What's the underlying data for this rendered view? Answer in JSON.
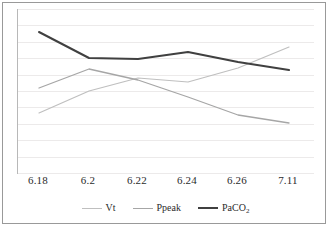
{
  "chart_data": {
    "type": "line",
    "title": "",
    "xlabel": "",
    "ylabel": "",
    "grid": true,
    "legend_position": "bottom",
    "categories": [
      "6.18",
      "6.2",
      "6.22",
      "6.24",
      "6.26",
      "7.11"
    ],
    "y_axis_visible_ticks": false,
    "ylim": [
      0,
      100
    ],
    "gridline_count": 11,
    "series": [
      {
        "name": "Vt",
        "color": "#bfbfbf",
        "line_width": 1.2,
        "values": [
          29,
          42,
          51,
          48,
          58,
          75
        ]
      },
      {
        "name": "Ppeak",
        "color": "#a6a6a6",
        "line_width": 1.3,
        "values": [
          44,
          57,
          50,
          38,
          27,
          23
        ]
      },
      {
        "name": "PaCO2",
        "name_display": "PaCO",
        "name_subscript": "2",
        "color": "#404040",
        "line_width": 2.0,
        "values": [
          89,
          73,
          72,
          77,
          69,
          64
        ]
      }
    ],
    "pixel_geometry": {
      "plot_left": 17,
      "plot_top": 9,
      "plot_width": 297,
      "plot_height": 165,
      "x_positions": [
        21,
        71,
        120,
        170,
        220,
        271
      ],
      "series_y_pixels": {
        "Vt": [
          104,
          82,
          69,
          73,
          59,
          38
        ],
        "Ppeak": [
          79,
          60,
          71,
          88,
          106,
          114
        ],
        "PaCO2": [
          23,
          49,
          50,
          43,
          53,
          61
        ]
      }
    }
  },
  "legend": {
    "entries": [
      {
        "label": "Vt",
        "sub": ""
      },
      {
        "label": "Ppeak",
        "sub": ""
      },
      {
        "label": "PaCO",
        "sub": "2"
      }
    ]
  },
  "colors": {
    "frame": "#999999",
    "axis": "#b8b8b8",
    "gridline": "#eceaea",
    "text": "#2b2b2b",
    "background": "#ffffff"
  }
}
